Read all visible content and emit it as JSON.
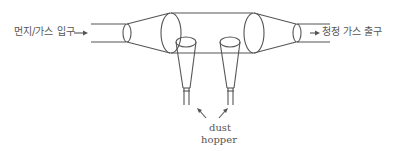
{
  "diagram": {
    "type": "dust collector (cyclone/settling chamber) schematic",
    "inlet_label": "먼지/가스 입구",
    "outlet_label": "청정 가스 출구",
    "hopper_label_line1": "dust",
    "hopper_label_line2": "hopper",
    "stroke_color": "#555555",
    "background_color": "#ffffff"
  }
}
